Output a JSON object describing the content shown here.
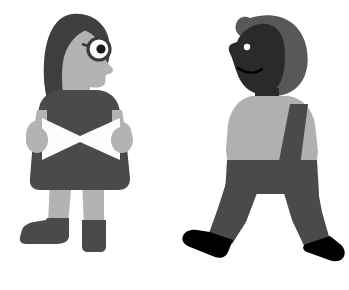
{
  "canvas": {
    "width": 349,
    "height": 290,
    "background": "#ffffff",
    "title": "Two grayscale flat-style human figures on white background"
  },
  "palette": {
    "background": "#ffffff",
    "paper_white": "#fdfdfd",
    "skin_light": "#b3b3b3",
    "shirt_light": "#b0b0b0",
    "garment_dark": "#4a4a4a",
    "hair_dark": "#3f3f3f",
    "hair_medium": "#585858",
    "face_dark": "#2a2a2a",
    "shoe_black": "#000000",
    "eye_white": "#ffffff",
    "outline_dark": "#3a3a3a"
  },
  "figures": [
    {
      "id": "figure-left",
      "name": "woman-reading",
      "description": "Standing woman with long dark hair, round eyeglasses, dark dress, holding an open white book",
      "facing": "right",
      "pose": "standing",
      "parts": [
        {
          "name": "hair",
          "color": "#3f3f3f"
        },
        {
          "name": "face",
          "color": "#b3b3b3"
        },
        {
          "name": "eyeglasses",
          "color": "#3a3a3a"
        },
        {
          "name": "eye",
          "color": "#ffffff"
        },
        {
          "name": "pupil",
          "color": "#1a1a1a"
        },
        {
          "name": "braid",
          "color": "#3f3f3f"
        },
        {
          "name": "dress",
          "color": "#4a4a4a"
        },
        {
          "name": "left-arm",
          "color": "#b3b3b3"
        },
        {
          "name": "right-arm",
          "color": "#b3b3b3"
        },
        {
          "name": "book",
          "color": "#fdfdfd"
        },
        {
          "name": "left-leg",
          "color": "#b3b3b3"
        },
        {
          "name": "right-leg",
          "color": "#b3b3b3"
        },
        {
          "name": "left-shoe",
          "color": "#4a4a4a"
        },
        {
          "name": "right-shoe",
          "color": "#4a4a4a"
        }
      ]
    },
    {
      "id": "figure-right",
      "name": "man-walking",
      "description": "Walking man with rounded gray hair, dark face with small eye and smile, light gray shirt, dark trousers and black shoes",
      "facing": "left",
      "pose": "walking",
      "parts": [
        {
          "name": "hair",
          "color": "#585858"
        },
        {
          "name": "face",
          "color": "#2a2a2a"
        },
        {
          "name": "eye",
          "color": "#ffffff"
        },
        {
          "name": "mouth",
          "color": "#000000"
        },
        {
          "name": "neck",
          "color": "#2a2a2a"
        },
        {
          "name": "shirt",
          "color": "#b0b0b0"
        },
        {
          "name": "arm",
          "color": "#4a4a4a"
        },
        {
          "name": "trousers",
          "color": "#4a4a4a"
        },
        {
          "name": "front-leg",
          "color": "#4a4a4a"
        },
        {
          "name": "back-leg",
          "color": "#4a4a4a"
        },
        {
          "name": "front-shoe",
          "color": "#000000"
        },
        {
          "name": "back-shoe",
          "color": "#000000"
        }
      ]
    }
  ]
}
